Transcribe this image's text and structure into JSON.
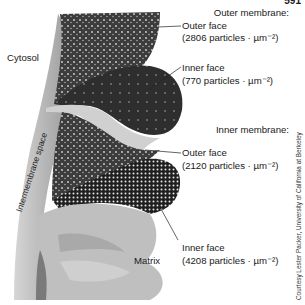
{
  "figure": {
    "page_number": "591",
    "regions": {
      "cytosol": "Cytosol",
      "intermembrane_space": "Intermembrane space",
      "matrix": "Matrix"
    },
    "outer_membrane": {
      "heading": "Outer membrane:",
      "outer_face": {
        "label": "Outer face",
        "density": "(2806 particles · µm⁻²)"
      },
      "inner_face": {
        "label": "Inner face",
        "density": "(770 particles · µm⁻²)"
      }
    },
    "inner_membrane": {
      "heading": "Inner membrane:",
      "outer_face": {
        "label": "Outer face",
        "density": "(2120 particles · µm⁻²)"
      },
      "inner_face": {
        "label": "Inner face",
        "density": "(4208 particles · µm⁻²)"
      }
    },
    "credit": "Courtesy Lester Packer, University of California at Berkeley",
    "colors": {
      "dark_membrane": "#3a3a3a",
      "light_membrane": "#c8c8c8",
      "matrix": "#bdbdbd",
      "background": "#ffffff"
    }
  }
}
